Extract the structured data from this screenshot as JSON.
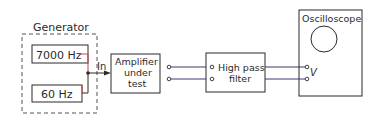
{
  "diagram": {
    "generator": {
      "label": "Generator",
      "sources": [
        {
          "label": "7000 Hz"
        },
        {
          "label": "60 Hz"
        }
      ],
      "output_label": "In"
    },
    "amplifier": {
      "line1": "Amplifier",
      "line2": "under",
      "line3": "test"
    },
    "filter": {
      "line1": "High pass",
      "line2": "filter"
    },
    "oscilloscope": {
      "label": "Oscilloscope",
      "input_label": "V"
    },
    "colors": {
      "line": "#2a2a2a",
      "accent_red": "#d0454a",
      "wire_blue": "#3a3a7a"
    }
  }
}
